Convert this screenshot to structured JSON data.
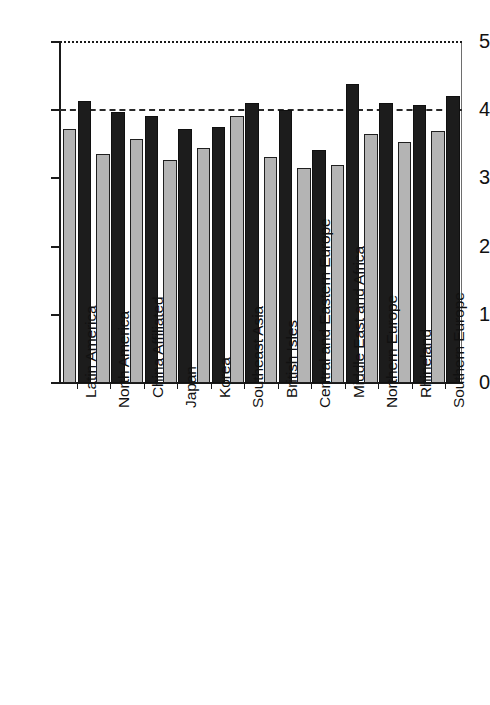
{
  "chart_data": {
    "type": "bar",
    "title": "",
    "subtitle": "",
    "xlabel": "",
    "ylabel": "",
    "ylim": [
      0,
      5
    ],
    "yticks": [
      "0",
      "1",
      "2",
      "3",
      "4",
      "5"
    ],
    "grid": "horizontal dashed reference lines at y=4 and y=5",
    "gridlines": [
      4,
      5
    ],
    "legend": "none",
    "legend_position": "none",
    "categories": [
      "Latin America",
      "North America",
      "China Affiliated",
      "Japan",
      "Korea",
      "Southeast Asia",
      "British Isles",
      "Central and Eastern Europe",
      "Middle East and Africa",
      "Northern Europe",
      "Rhineland",
      "Southern Europe"
    ],
    "series": [
      {
        "name": "gray",
        "color": "#b4b4b4",
        "values": [
          3.72,
          3.36,
          3.58,
          3.27,
          3.45,
          3.92,
          3.32,
          3.16,
          3.2,
          3.65,
          3.53,
          3.7
        ]
      },
      {
        "name": "black",
        "color": "#1c1c1c",
        "values": [
          4.13,
          3.98,
          3.92,
          3.73,
          3.76,
          4.11,
          4.0,
          3.41,
          4.38,
          4.11,
          4.08,
          4.21
        ]
      }
    ]
  },
  "axes": {
    "y_tick_labels": [
      "0",
      "1",
      "2",
      "3",
      "4",
      "5"
    ],
    "y_min": 0,
    "y_max": 5
  }
}
